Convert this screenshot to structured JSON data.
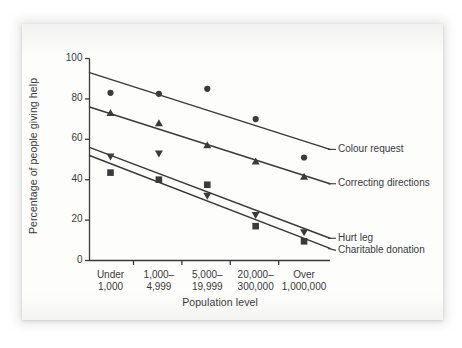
{
  "figure": {
    "background_color": "#fdfdfc",
    "page_color": "#ffffff",
    "ink_color": "#3a3a3c"
  },
  "chart_data": {
    "type": "scatter",
    "title": "",
    "xlabel": "Population level",
    "ylabel": "Percentage of people giving help",
    "categories": [
      "Under\n1,000",
      "1,000–\n4,999",
      "5,000–\n19,999",
      "20,000–\n300,000",
      "Over\n1,000,000"
    ],
    "category_lines": [
      [
        "Under",
        "1,000"
      ],
      [
        "1,000–",
        "4,999"
      ],
      [
        "5,000–",
        "19,999"
      ],
      [
        "20,000–",
        "300,000"
      ],
      [
        "Over",
        "1,000,000"
      ]
    ],
    "ylim": [
      0,
      100
    ],
    "yticks": [
      0,
      20,
      40,
      60,
      80,
      100
    ],
    "grid": false,
    "legend_position": "right-inline",
    "series": [
      {
        "name": "Colour request",
        "marker": "circle",
        "values": [
          83,
          82.5,
          85,
          70,
          51
        ],
        "trend_start": 93,
        "trend_end": 55,
        "label_y": 55
      },
      {
        "name": "Correcting directions",
        "marker": "triangle-up",
        "values": [
          73,
          68,
          57,
          49,
          41.5
        ],
        "trend_start": 76,
        "trend_end": 38,
        "label_y": 38
      },
      {
        "name": "Hurt leg",
        "marker": "triangle-down",
        "values": [
          51.5,
          53,
          32,
          22.5,
          14
        ],
        "trend_start": 56,
        "trend_end": 11,
        "label_y": 11
      },
      {
        "name": "Charitable donation",
        "marker": "square",
        "values": [
          43.5,
          40,
          37.5,
          17,
          9.5
        ],
        "trend_start": 52,
        "trend_end": 6,
        "label_y": 5
      }
    ]
  }
}
